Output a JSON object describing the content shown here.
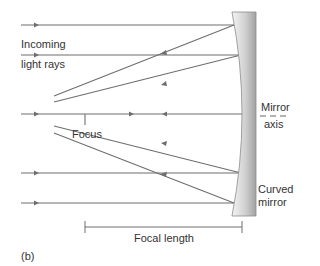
{
  "labels": {
    "incoming": "Incoming",
    "light_rays": "light rays",
    "focus": "Focus",
    "mirror": "Mirror",
    "axis": "axis",
    "curved": "Curved",
    "mirror2": "mirror",
    "focal_length": "Focal length",
    "panel": "(b)"
  },
  "colors": {
    "ray": "#6e6e6e",
    "mirror_light": "#f2f2f2",
    "mirror_dark": "#a8a8a8",
    "text": "#333333"
  },
  "geometry": {
    "focus": [
      85,
      114
    ],
    "incoming_rays_y": [
      25,
      55,
      114,
      173,
      203
    ],
    "mirror_x_range": [
      232,
      256
    ],
    "focal_bar": {
      "y": 227,
      "x1": 85,
      "x2": 242
    }
  }
}
